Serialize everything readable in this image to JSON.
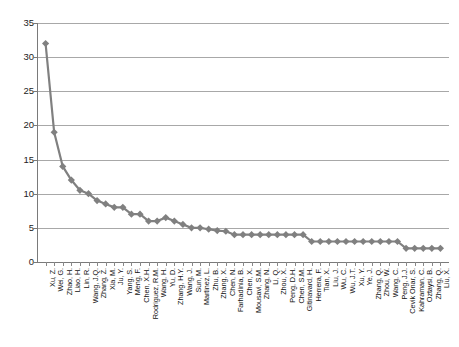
{
  "chart_data": {
    "type": "line",
    "title": "",
    "subtitle": "",
    "xlabel": "",
    "ylabel": "",
    "ylim": [
      0,
      35
    ],
    "ytick_labels": [
      "0",
      "5",
      "10",
      "15",
      "20",
      "25",
      "30",
      "35"
    ],
    "ytick_values": [
      0,
      5,
      10,
      15,
      20,
      25,
      30,
      35
    ],
    "grid": true,
    "legend": "none",
    "marker": "diamond",
    "series_color": "#808080",
    "line_color": "#808080",
    "categories": [
      "Xu, Z.",
      "Wei, G.",
      "Zhao, H.",
      "Liao, H.",
      "Lin, R.",
      "Wang, J.Q.",
      "Zhang, Z.",
      "Xia, M.",
      "Ju, Y.",
      "Yang, S.",
      "Meng, F.",
      "Chen, X.H.",
      "Rodriguez, R.M.",
      "Wang, H.",
      "Yu, D.",
      "Zhang, H.Y.",
      "Wang, J.",
      "Sun, M.",
      "Martinez, L.",
      "Zhu, B.",
      "Zhang, X.",
      "Chen, N.",
      "Farhadinia, B.",
      "Chen, X.",
      "Mousavi, S.M.",
      "Zhang, N.",
      "Li, Q.",
      "Zhou, X.",
      "Peng, D.H.",
      "Chen, S.M.",
      "Gitinavard, H.",
      "Herrera, F.",
      "Tian, X.",
      "Liu, J.",
      "Wu, C.",
      "Wu, J.T.",
      "Xu, Y.",
      "Ye, J.",
      "Zhang, Q.",
      "Zhou, W.",
      "Wang, C.",
      "Peng, J.J.",
      "Cevik Onar, S.",
      "Kahraman, C.",
      "Oztaysi, B.",
      "Zhang, Q.",
      "Liu, X."
    ],
    "values": [
      32,
      19,
      14,
      12,
      10.5,
      10,
      9,
      8.5,
      8,
      8,
      7,
      7,
      6,
      6,
      6.5,
      6,
      5.5,
      5,
      5,
      4.8,
      4.6,
      4.5,
      4,
      4,
      4,
      4,
      4,
      4,
      4,
      4,
      4,
      3,
      3,
      3,
      3,
      3,
      3,
      3,
      3,
      3,
      3,
      3,
      2,
      2,
      2,
      2,
      2
    ]
  }
}
